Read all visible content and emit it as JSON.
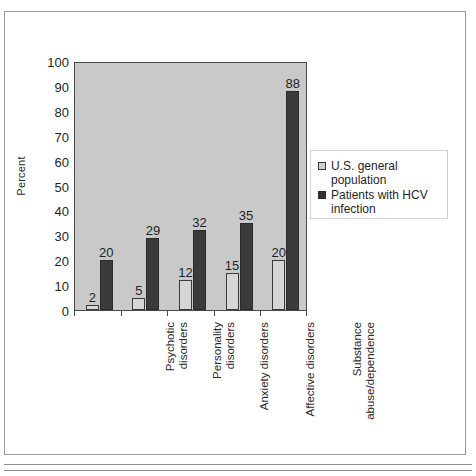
{
  "chart_data": {
    "type": "bar",
    "title": "",
    "subtitle": "",
    "xlabel": "",
    "ylabel": "Percent",
    "ylim": [
      0,
      100
    ],
    "ytick_step": 10,
    "yticks": [
      0,
      10,
      20,
      30,
      40,
      50,
      60,
      70,
      80,
      90,
      100
    ],
    "grid": false,
    "legend_position": "right",
    "categories": [
      "Psychotic\ndisorders",
      "Personality\ndisorders",
      "Anxiety disorders",
      "Affective disorders",
      "Substance\nabuse/dependence"
    ],
    "series": [
      {
        "name": "U.S. general population",
        "values": [
          2,
          5,
          12,
          15,
          20
        ],
        "color": "#d6d6d6"
      },
      {
        "name": "Patients with HCV\ninfection",
        "values": [
          20,
          29,
          32,
          35,
          88
        ],
        "color": "#3b3b3b"
      }
    ],
    "value_labels": [
      [
        "2",
        "20"
      ],
      [
        "5",
        "29"
      ],
      [
        "12",
        "32"
      ],
      [
        "15",
        "35"
      ],
      [
        "20",
        "88"
      ]
    ]
  },
  "legend": {
    "items": [
      {
        "label": "U.S. general population"
      },
      {
        "label": "Patients with HCV\ninfection"
      }
    ]
  },
  "colors": {
    "plot_background": "#c9c9c9",
    "series_light": "#d6d6d6",
    "series_dark": "#3b3b3b",
    "axis": "#4a4a4a",
    "frame": "#9a9a9a",
    "text": "#1f1f1f"
  }
}
